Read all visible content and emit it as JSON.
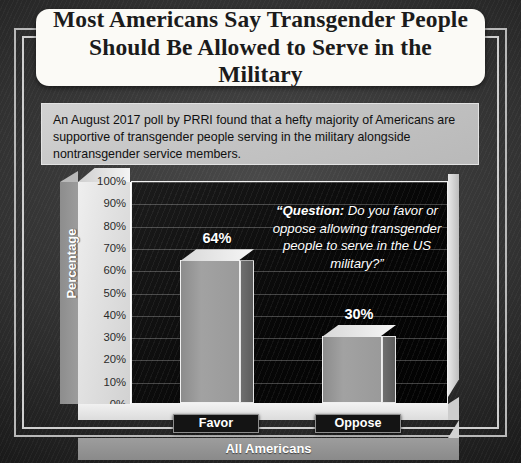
{
  "title": "Most Americans Say Transgender People Should Be Allowed to Serve in the Military",
  "intro": "An August 2017 poll by PRRI found that a hefty majority of Americans are supportive of transgender people serving in the military alongside nontransgender service members.",
  "question": {
    "prefix": "“Question:",
    "body": " Do you favor or oppose allowing transgender people to serve in the US military?”"
  },
  "chart_data": {
    "type": "bar",
    "title": "Most Americans Say Transgender People Should Be Allowed to Serve in the Military",
    "categories": [
      "Favor",
      "Oppose"
    ],
    "values": [
      64,
      30
    ],
    "value_labels": [
      "64%",
      "30%"
    ],
    "xlabel": "All Americans",
    "ylabel": "Percentage",
    "ylim": [
      0,
      100
    ],
    "ytick_labels": [
      "100%",
      "90%",
      "80%",
      "70%",
      "60%",
      "50%",
      "40%",
      "30%",
      "20%",
      "10%",
      "0%"
    ],
    "ytick_values": [
      100,
      90,
      80,
      70,
      60,
      50,
      40,
      30,
      20,
      10,
      0
    ],
    "grid": true,
    "legend": "none",
    "group_label": "All Americans",
    "source_note": "An August 2017 poll by PRRI",
    "annotation": "“Question: Do you favor or oppose allowing transgender people to serve in the US military?”"
  },
  "colors": {
    "title_background": "#fbfaf6",
    "title_text": "#1b1b1b",
    "intro_background": "#c6c6c6",
    "plot_background": "#0a0a0a",
    "bar_face": "#9a9a9a",
    "bar_top": "#ececec",
    "bar_side": "#656565",
    "value_text": "#ffffff",
    "band_background": "#939393",
    "frame": "#c2c2c2"
  }
}
